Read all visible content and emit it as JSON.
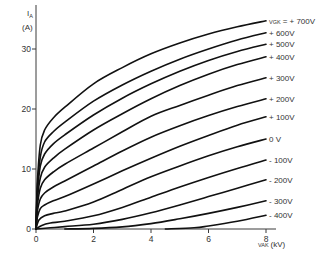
{
  "chart_data": {
    "type": "line",
    "title": "",
    "xlabel": "V_AK (kV)",
    "ylabel": "I_A (A)",
    "xlim": [
      0,
      8.3
    ],
    "ylim": [
      0,
      35
    ],
    "grid": false,
    "legend_position": "inline labels at right end of curves",
    "x_ticks": [
      0,
      2,
      4,
      6,
      8
    ],
    "x_tick_labels": [
      "0",
      "2",
      "4",
      "6",
      "8"
    ],
    "y_ticks": [
      0,
      10,
      20,
      30
    ],
    "y_tick_labels": [
      "0",
      "10",
      "20",
      "30"
    ],
    "parameter_label": "V_GK =",
    "series": [
      {
        "name": "+700V",
        "label": "V_GK = +700V",
        "x": [
          0,
          0.05,
          0.15,
          0.3,
          0.6,
          1,
          2,
          3,
          4,
          5,
          6,
          7,
          8
        ],
        "values": [
          0,
          8,
          14,
          16.5,
          18.5,
          20.3,
          24.2,
          26.9,
          29.2,
          31.0,
          32.5,
          33.7,
          34.7
        ]
      },
      {
        "name": "+600V",
        "label": "+600V",
        "x": [
          0,
          0.05,
          0.15,
          0.3,
          0.6,
          1,
          2,
          3,
          4,
          5,
          6,
          7,
          8
        ],
        "values": [
          0,
          7,
          12,
          14.5,
          16.2,
          17.8,
          21.3,
          24.0,
          26.3,
          28.3,
          30.0,
          31.5,
          32.7
        ]
      },
      {
        "name": "+500V",
        "label": "+500V",
        "x": [
          0,
          0.05,
          0.15,
          0.3,
          0.6,
          1,
          2,
          3,
          4,
          5,
          6,
          7,
          8
        ],
        "values": [
          0,
          6,
          10.5,
          12.5,
          14.2,
          15.7,
          19.0,
          21.8,
          24.2,
          26.3,
          28.1,
          29.6,
          30.8
        ]
      },
      {
        "name": "+400V",
        "label": "+400V",
        "x": [
          0,
          0.05,
          0.15,
          0.3,
          0.6,
          1,
          2,
          3,
          4,
          5,
          6,
          7,
          8
        ],
        "values": [
          0,
          5,
          8.5,
          10.3,
          11.8,
          13.3,
          16.5,
          19.2,
          21.7,
          23.9,
          25.8,
          27.4,
          28.7
        ]
      },
      {
        "name": "+300V",
        "label": "+300V",
        "x": [
          0,
          0.05,
          0.15,
          0.3,
          0.6,
          1,
          2,
          3,
          4,
          5,
          6,
          7,
          8
        ],
        "values": [
          0,
          4,
          6.8,
          8.2,
          9.5,
          10.8,
          13.5,
          16.2,
          18.8,
          20.6,
          22.3,
          23.9,
          25.2
        ]
      },
      {
        "name": "+200V",
        "label": "+200V",
        "x": [
          0,
          0.05,
          0.15,
          0.3,
          0.6,
          1,
          2,
          3,
          4,
          5,
          6,
          7,
          8
        ],
        "values": [
          0,
          3,
          5.0,
          6.0,
          7.0,
          8.0,
          10.5,
          13.0,
          15.3,
          17.2,
          18.9,
          20.4,
          21.7
        ]
      },
      {
        "name": "+100V",
        "label": "+100V",
        "x": [
          0,
          0.05,
          0.15,
          0.3,
          0.6,
          1,
          2,
          3,
          4,
          5,
          6,
          7,
          8
        ],
        "values": [
          0,
          2,
          3.4,
          4.0,
          4.7,
          5.4,
          7.5,
          9.7,
          11.8,
          13.8,
          15.6,
          17.3,
          18.7
        ]
      },
      {
        "name": "0V",
        "label": "0V",
        "x": [
          0,
          0.1,
          0.3,
          0.6,
          1,
          2,
          3,
          4,
          5,
          6,
          7,
          8
        ],
        "values": [
          0,
          1.5,
          2.2,
          2.6,
          3.0,
          4.5,
          6.6,
          8.7,
          10.5,
          12.2,
          13.7,
          15.0
        ]
      },
      {
        "name": "-100V",
        "label": "-100V",
        "x": [
          0,
          0.2,
          0.5,
          1,
          2,
          3,
          4,
          5,
          6,
          7,
          8
        ],
        "values": [
          0,
          0.6,
          1.0,
          1.3,
          2.2,
          3.6,
          5.3,
          7.0,
          8.6,
          10.1,
          11.5
        ]
      },
      {
        "name": "-200V",
        "label": "-200V",
        "x": [
          0,
          0.5,
          1,
          2,
          3,
          4,
          5,
          6,
          7,
          8
        ],
        "values": [
          0,
          0.2,
          0.4,
          0.8,
          1.6,
          2.7,
          4.0,
          5.4,
          6.8,
          8.2
        ]
      },
      {
        "name": "-300V",
        "label": "-300V",
        "x": [
          1.0,
          2,
          3,
          4,
          5,
          6,
          7,
          8
        ],
        "values": [
          0,
          0.1,
          0.35,
          0.9,
          1.7,
          2.6,
          3.6,
          4.7
        ]
      },
      {
        "name": "-400V",
        "label": "-400V",
        "x": [
          4.5,
          5.5,
          6,
          7,
          8
        ],
        "values": [
          0,
          0.2,
          0.5,
          1.3,
          2.3
        ]
      }
    ]
  },
  "axes": {
    "y_title_main": "I",
    "y_title_sub": "A",
    "y_unit": "(A)",
    "x_title_main": "V",
    "x_title_sub": "AK",
    "x_unit": "(kV)",
    "param_main": "V",
    "param_sub": "GK",
    "param_eq": "= "
  }
}
